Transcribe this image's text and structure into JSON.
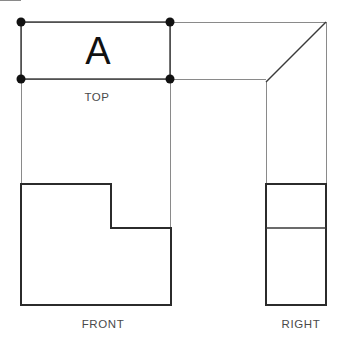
{
  "drawing": {
    "title": "Orthographic Projection Worksheet",
    "background_color": "#ffffff",
    "canvas": {
      "width": 344,
      "height": 349
    },
    "colors": {
      "object_line": "#2b2b2b",
      "construction_line": "#8a8a8a",
      "vertex_dot": "#111111",
      "label_text": "#4a4a4a",
      "surface_label_text": "#111111"
    },
    "surface_label": {
      "text": "A",
      "x": 98,
      "y": 64
    },
    "view_labels": [
      {
        "key": "top",
        "text": "TOP",
        "x": 97,
        "y": 101
      },
      {
        "key": "front",
        "text": "FRONT",
        "x": 103,
        "y": 328
      },
      {
        "key": "right",
        "text": "RIGHT",
        "x": 301,
        "y": 328
      }
    ],
    "vertex_dots": [
      {
        "key": "top-view-corner-top-left",
        "cx": 21,
        "cy": 22,
        "r": 4.5
      },
      {
        "key": "top-view-corner-top-right",
        "cx": 170,
        "cy": 22,
        "r": 4.5
      },
      {
        "key": "top-view-corner-bottom-left",
        "cx": 21,
        "cy": 79,
        "r": 4.5
      },
      {
        "key": "top-view-corner-bottom-right",
        "cx": 170,
        "cy": 79,
        "r": 4.5
      }
    ],
    "construction_lines": [
      {
        "key": "horizontal-top-extension",
        "x1": 21,
        "y1": 22,
        "x2": 326,
        "y2": 22
      },
      {
        "key": "horizontal-depth-extension",
        "x1": 21,
        "y1": 79,
        "x2": 266,
        "y2": 79
      },
      {
        "key": "vertical-left-extension",
        "x1": 21,
        "y1": 22,
        "x2": 21,
        "y2": 185
      },
      {
        "key": "vertical-mid-extension",
        "x1": 170,
        "y1": 22,
        "x2": 170,
        "y2": 229
      },
      {
        "key": "vertical-right-boundary",
        "x1": 326,
        "y1": 22,
        "x2": 326,
        "y2": 185
      },
      {
        "key": "vertical-right-view-left",
        "x1": 266,
        "y1": 82,
        "x2": 266,
        "y2": 185
      }
    ],
    "top_view": {
      "name": "TOP",
      "rect": {
        "x": 21,
        "y": 22,
        "width": 149,
        "height": 57
      }
    },
    "right_view": {
      "name": "RIGHT",
      "miter_line": {
        "x1": 326,
        "y1": 22,
        "x2": 266,
        "y2": 82
      },
      "rect": {
        "x": 266,
        "y": 184,
        "width": 60,
        "height": 121
      },
      "divider_line": {
        "x1": 266,
        "y1": 228,
        "x2": 326,
        "y2": 228
      }
    },
    "front_view": {
      "name": "FRONT",
      "outline_points": "21,184 111,184 111,228 171,228 171,305 21,305",
      "notch": {
        "step_x": 111,
        "step_y": 228,
        "top_y": 184,
        "right_x": 171,
        "bottom_y": 305,
        "left_x": 21
      }
    }
  }
}
